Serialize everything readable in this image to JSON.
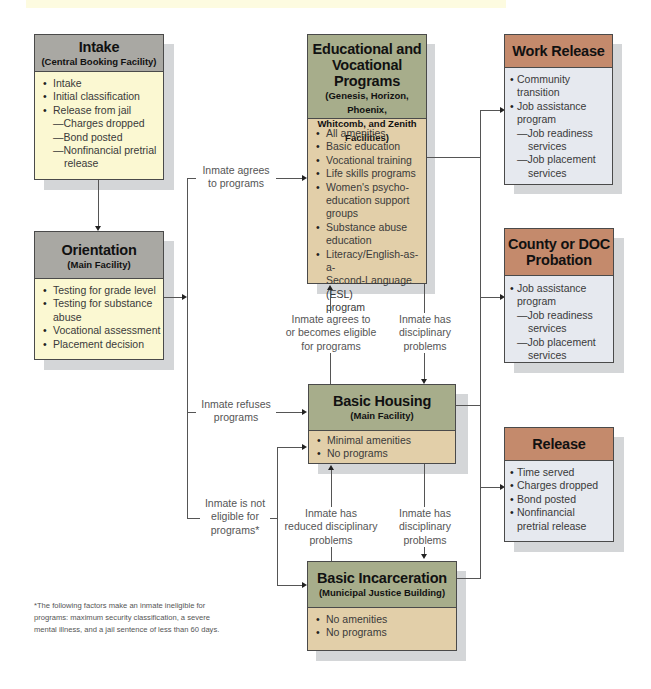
{
  "banner": {
    "text": ""
  },
  "boxes": {
    "intake": {
      "title": "Intake",
      "subtitle": "(Central Booking Facility)",
      "items": [
        "Intake",
        "Initial classification",
        "Release from jail"
      ],
      "subitems": [
        "—Charges dropped",
        "—Bond posted",
        "—Nonfinancial pretrial",
        "release"
      ]
    },
    "orientation": {
      "title": "Orientation",
      "subtitle": "(Main Facility)",
      "items": [
        "Testing for grade level",
        "Testing for substance",
        "abuse",
        "Vocational assessment",
        "Placement decision"
      ]
    },
    "educational": {
      "title1": "Educational and",
      "title2": "Vocational Programs",
      "subtitle1": "(Genesis, Horizon, Phoenix,",
      "subtitle2": "Whitcomb, and Zenith",
      "subtitle3": "Facilities)",
      "items": [
        "All amenities",
        "Basic education",
        "Vocational training",
        "Life skills programs",
        "Women's psycho-",
        "education support groups",
        "Substance abuse",
        "education",
        "Literacy/English-as-a-",
        "Second-Language (ESL)",
        "program"
      ]
    },
    "basic_housing": {
      "title": "Basic Housing",
      "subtitle": "(Main Facility)",
      "items": [
        "Minimal amenities",
        "No programs"
      ]
    },
    "basic_incarceration": {
      "title": "Basic Incarceration",
      "subtitle": "(Municipal Justice Building)",
      "items": [
        "No amenities",
        "No programs"
      ]
    },
    "work_release": {
      "title": "Work Release",
      "items": [
        "Community",
        "transition",
        "Job assistance",
        "program",
        "—Job readiness",
        "services",
        "—Job placement",
        "services"
      ]
    },
    "probation": {
      "title1": "County or DOC",
      "title2": "Probation",
      "items": [
        "Job assistance",
        "program",
        "—Job readiness",
        "services",
        "—Job placement",
        "services"
      ]
    },
    "release": {
      "title": "Release",
      "items": [
        "Time served",
        "Charges dropped",
        "Bond posted",
        "Nonfinancial",
        "pretrial release"
      ]
    }
  },
  "labels": {
    "agrees": "Inmate agrees\nto programs",
    "refuses": "Inmate refuses\nprograms",
    "not_eligible": "Inmate is not\neligible for\nprograms*",
    "agrees_or_eligible": "Inmate agrees to\nor becomes eligible\nfor programs",
    "disciplinary1": "Inmate has\ndisciplinary\nproblems",
    "reduced": "Inmate has\nreduced disciplinary\nproblems",
    "disciplinary2": "Inmate has\ndisciplinary\nproblems"
  },
  "footnote": "*The following factors make an inmate ineligible for programs: maximum security classification, a severe mental illness, and a jail sentence of less than 60 days.",
  "colors": {
    "header_gray": "#a9a8a3",
    "header_green": "#a7ad8b",
    "header_rust": "#c48a6c",
    "body_yellow": "#fbf8d2",
    "body_tan": "#e2cfa9",
    "body_blue": "#e6e9ef"
  }
}
